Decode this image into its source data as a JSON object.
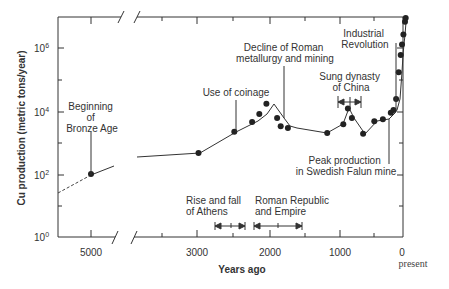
{
  "chart_data": {
    "type": "line",
    "title": "",
    "xlabel": "Years ago",
    "ylabel": "Cu production (metric tons/year)",
    "yscale": "log",
    "ylim": [
      1,
      10000000
    ],
    "y_ticks": [
      {
        "label": "10",
        "exp": "0",
        "value": 1
      },
      {
        "label": "10",
        "exp": "2",
        "value": 100
      },
      {
        "label": "10",
        "exp": "4",
        "value": 10000
      },
      {
        "label": "10",
        "exp": "6",
        "value": 1000000
      }
    ],
    "x_ticks": [
      {
        "label": "5000",
        "value": 5000
      },
      {
        "label": "3000",
        "value": 3000
      },
      {
        "label": "2000",
        "value": 2000
      },
      {
        "label": "1000",
        "value": 1000
      },
      {
        "label": "0",
        "value": 0
      }
    ],
    "x_present_label": "present",
    "x_reversed": true,
    "axis_break": "between 5000 and ~3500 years ago",
    "grid": false,
    "legend": null,
    "series": [
      {
        "name": "Cu production",
        "points": [
          {
            "years_ago": 5000,
            "value": 100
          },
          {
            "years_ago": 3000,
            "value": 460
          },
          {
            "years_ago": 2500,
            "value": 2200
          },
          {
            "years_ago": 2250,
            "value": 4500
          },
          {
            "years_ago": 2150,
            "value": 8000
          },
          {
            "years_ago": 2050,
            "value": 17000
          },
          {
            "years_ago": 1900,
            "value": 6000
          },
          {
            "years_ago": 1850,
            "value": 3300
          },
          {
            "years_ago": 1750,
            "value": 2900
          },
          {
            "years_ago": 1200,
            "value": 2000
          },
          {
            "years_ago": 950,
            "value": 3800
          },
          {
            "years_ago": 880,
            "value": 12000
          },
          {
            "years_ago": 820,
            "value": 6000
          },
          {
            "years_ago": 650,
            "value": 1900
          },
          {
            "years_ago": 480,
            "value": 4700
          },
          {
            "years_ago": 350,
            "value": 5500
          },
          {
            "years_ago": 230,
            "value": 8800
          },
          {
            "years_ago": 190,
            "value": 10800
          },
          {
            "years_ago": 150,
            "value": 24000
          },
          {
            "years_ago": 110,
            "value": 170000
          },
          {
            "years_ago": 80,
            "value": 600000
          },
          {
            "years_ago": 60,
            "value": 1300000
          },
          {
            "years_ago": 40,
            "value": 2700000
          },
          {
            "years_ago": 15,
            "value": 6800000
          },
          {
            "years_ago": 5,
            "value": 9000000
          }
        ],
        "extrapolated_segment": {
          "from_years_ago": 5500,
          "from_value": 15,
          "to_years_ago": 5000,
          "to_value": 100,
          "style": "dashed"
        }
      }
    ],
    "annotations": [
      {
        "text": [
          "Beginning",
          "of",
          "Bronze Age"
        ],
        "points_to_years_ago": 5000
      },
      {
        "text": [
          "Use of coinage"
        ],
        "points_to_years_ago": 2500
      },
      {
        "text": [
          "Decline of Roman",
          "metallurgy and mining"
        ],
        "points_to_years_ago": 1900
      },
      {
        "text": [
          "Sung dynasty",
          "of China"
        ],
        "range_years_ago": [
          1000,
          800
        ]
      },
      {
        "text": [
          "Industrial",
          "Revolution"
        ],
        "points_to_years_ago": 190
      },
      {
        "text": [
          "Peak production",
          "in Swedish Falun mine"
        ],
        "points_to_years_ago": 350
      },
      {
        "text": [
          "Rise and fall",
          "of Athens"
        ],
        "range_years_ago": [
          2750,
          2350
        ]
      },
      {
        "text": [
          "Roman Republic",
          "and Empire"
        ],
        "range_years_ago": [
          2200,
          1550
        ]
      }
    ]
  }
}
